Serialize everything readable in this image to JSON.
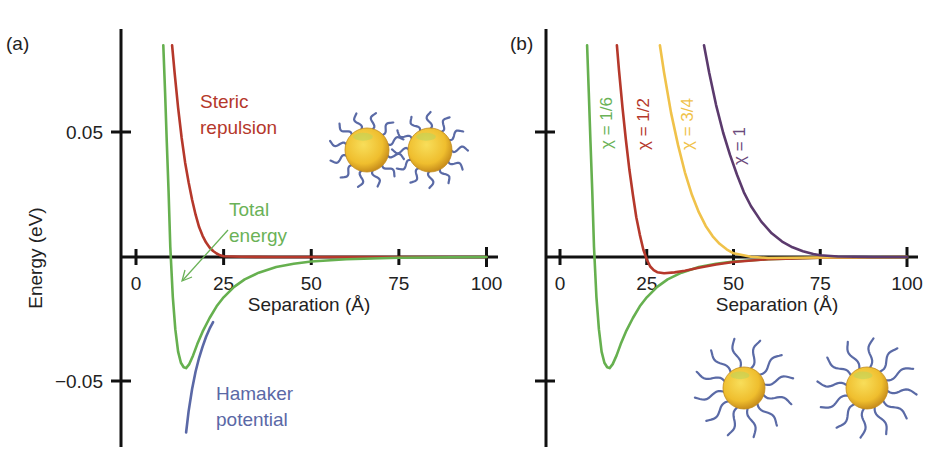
{
  "chart_data": [
    {
      "panel": "(a)",
      "type": "line",
      "title": "",
      "xlabel": "Separation (Å)",
      "ylabel": "Energy (eV)",
      "xlim": [
        0,
        100
      ],
      "ylim": [
        -0.075,
        0.09
      ],
      "xticks": [
        0,
        25,
        50,
        75,
        100
      ],
      "yticks": [
        0.05,
        -0.05
      ],
      "ytick_labels": [
        "0.05",
        "−0.05"
      ],
      "grid": false,
      "legend": "inline annotations",
      "annotations": [
        {
          "text": "Steric",
          "text2": "repulsion",
          "color": "#b5382b"
        },
        {
          "text": "Total",
          "text2": "energy",
          "color": "#66b04f"
        },
        {
          "text": "Hamaker",
          "text2": "potential",
          "color": "#5a68a6"
        }
      ],
      "series": [
        {
          "name": "Steric repulsion",
          "color": "#b5382b",
          "x": [
            10.3,
            11,
            12,
            13,
            14,
            15,
            16,
            17,
            18,
            19,
            20,
            21,
            22,
            23,
            24,
            25,
            30,
            40,
            50,
            75,
            100
          ],
          "y": [
            0.085,
            0.074,
            0.06,
            0.048,
            0.038,
            0.03,
            0.023,
            0.017,
            0.012,
            0.0085,
            0.0058,
            0.0038,
            0.0024,
            0.0014,
            0.0007,
            0.0003,
            0.0001,
            0.0,
            0.0,
            0.0,
            0.0
          ]
        },
        {
          "name": "Total energy",
          "color": "#66b04f",
          "x": [
            7.8,
            8.3,
            8.8,
            9.3,
            9.8,
            10.5,
            11.2,
            12,
            12.8,
            13.6,
            14.3,
            15.2,
            16.3,
            17.5,
            19,
            21,
            23,
            25,
            28,
            31,
            35,
            40,
            45,
            50,
            60,
            75,
            90,
            100
          ],
          "y": [
            0.085,
            0.066,
            0.046,
            0.026,
            0.004,
            -0.016,
            -0.029,
            -0.038,
            -0.0425,
            -0.0443,
            -0.0446,
            -0.043,
            -0.0395,
            -0.035,
            -0.03,
            -0.0245,
            -0.0198,
            -0.0162,
            -0.012,
            -0.009,
            -0.0063,
            -0.004,
            -0.0027,
            -0.0018,
            -0.0009,
            -0.0003,
            -0.0001,
            0.0
          ]
        },
        {
          "name": "Hamaker potential",
          "color": "#5a68a6",
          "x": [
            14.3,
            15,
            16,
            17,
            18,
            19,
            20,
            21,
            22
          ],
          "y": [
            -0.0705,
            -0.062,
            -0.053,
            -0.046,
            -0.0405,
            -0.036,
            -0.032,
            -0.0288,
            -0.0262
          ]
        }
      ]
    },
    {
      "panel": "(b)",
      "type": "line",
      "title": "",
      "xlabel": "Separation (Å)",
      "ylabel": "",
      "xlim": [
        0,
        100
      ],
      "ylim": [
        -0.075,
        0.09
      ],
      "xticks": [
        0,
        25,
        50,
        75,
        100
      ],
      "yticks": [
        0.05,
        -0.05
      ],
      "grid": false,
      "legend": "inline rotated labels",
      "series": [
        {
          "name": "χ = 1/6",
          "color": "#66b04f",
          "x": [
            7.8,
            8.3,
            8.8,
            9.3,
            9.8,
            10.5,
            11.2,
            12,
            12.8,
            13.6,
            14.3,
            15.2,
            16.3,
            17.5,
            19,
            21,
            23,
            25,
            28,
            31,
            35,
            40,
            45,
            50,
            60,
            75,
            90,
            100
          ],
          "y": [
            0.085,
            0.066,
            0.046,
            0.026,
            0.004,
            -0.016,
            -0.029,
            -0.038,
            -0.0425,
            -0.0443,
            -0.0446,
            -0.043,
            -0.0395,
            -0.035,
            -0.03,
            -0.0245,
            -0.0198,
            -0.0162,
            -0.012,
            -0.009,
            -0.0063,
            -0.004,
            -0.0027,
            -0.0018,
            -0.0009,
            -0.0003,
            -0.0001,
            0.0
          ]
        },
        {
          "name": "χ = 1/2",
          "color": "#b5382b",
          "x": [
            16.4,
            17,
            18,
            19,
            20,
            21,
            22,
            23,
            24,
            25,
            26,
            27,
            28,
            30,
            33,
            36,
            40,
            45,
            50,
            60,
            75,
            100
          ],
          "y": [
            0.085,
            0.075,
            0.06,
            0.047,
            0.035,
            0.025,
            0.016,
            0.009,
            0.003,
            -0.001,
            -0.0038,
            -0.0053,
            -0.0061,
            -0.0065,
            -0.0062,
            -0.0055,
            -0.0043,
            -0.003,
            -0.002,
            -0.0009,
            -0.0003,
            0.0
          ]
        },
        {
          "name": "χ = 3/4",
          "color": "#f0c24a",
          "x": [
            28.8,
            30,
            32,
            34,
            36,
            38,
            40,
            42,
            44,
            46,
            48,
            50,
            55,
            60,
            75,
            100
          ],
          "y": [
            0.085,
            0.074,
            0.058,
            0.045,
            0.034,
            0.025,
            0.018,
            0.0125,
            0.0083,
            0.0053,
            0.0031,
            0.0015,
            0.0001,
            -0.0004,
            -0.0002,
            0.0
          ]
        },
        {
          "name": "χ = 1",
          "color": "#5b3a6d",
          "x": [
            41.5,
            43,
            45,
            47,
            49,
            51,
            53,
            55,
            58,
            61,
            64,
            67,
            70,
            73,
            75,
            80,
            90,
            100
          ],
          "y": [
            0.085,
            0.074,
            0.061,
            0.05,
            0.041,
            0.033,
            0.026,
            0.0205,
            0.0142,
            0.0095,
            0.0062,
            0.0039,
            0.0023,
            0.0012,
            0.0007,
            0.0002,
            0.0,
            0.0
          ]
        }
      ]
    }
  ],
  "panels": {
    "a": {
      "label": "(a)",
      "ylabel": "Energy (eV)",
      "xlabel": "Separation (Å)",
      "ytick_top": "0.05",
      "ytick_bottom": "−0.05",
      "xtick_labels": [
        "0",
        "25",
        "50",
        "75",
        "100"
      ],
      "steric_line1": "Steric",
      "steric_line2": "repulsion",
      "total_line1": "Total",
      "total_line2": "energy",
      "hamaker_line1": "Hamaker",
      "hamaker_line2": "potential"
    },
    "b": {
      "label": "(b)",
      "xlabel": "Separation (Å)",
      "xtick_labels": [
        "0",
        "25",
        "50",
        "75",
        "100"
      ],
      "chi_labels": [
        "χ = 1/6",
        "χ = 1/2",
        "χ = 3/4",
        "χ = 1"
      ]
    }
  },
  "colors": {
    "axis": "#111111",
    "green": "#66b04f",
    "red": "#b5382b",
    "blue": "#5a68a6",
    "yellow": "#f0c24a",
    "purple": "#5b3a6d",
    "particle_core": "#f2c230",
    "ligand": "#5a6aa6"
  }
}
